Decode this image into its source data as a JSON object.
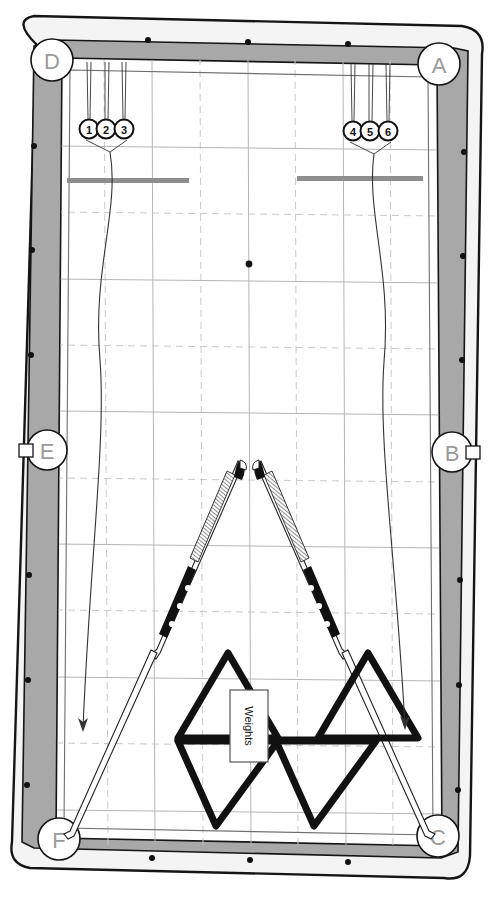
{
  "diagram": {
    "type": "billiard-table-schematic"
  },
  "table": {
    "cloth_color": "#ffffff",
    "rail_color": "#a8a8a8",
    "frame_outline_color": "#1a1a1a",
    "grid_color": "#b9b9b9",
    "grid_dashed_color": "#c7c7c7"
  },
  "pockets": [
    {
      "id": "A",
      "label": "A",
      "position": "top-right",
      "kind": "corner"
    },
    {
      "id": "B",
      "label": "B",
      "position": "right-middle",
      "kind": "side"
    },
    {
      "id": "C",
      "label": "C",
      "position": "bottom-right",
      "kind": "corner"
    },
    {
      "id": "D",
      "label": "D",
      "position": "top-left",
      "kind": "corner"
    },
    {
      "id": "E",
      "label": "E",
      "position": "left-middle",
      "kind": "side"
    },
    {
      "id": "F",
      "label": "F",
      "position": "bottom-left",
      "kind": "corner"
    }
  ],
  "callouts": {
    "left_group": {
      "labels": [
        "1",
        "2",
        "3"
      ],
      "target": "lower-left area",
      "arrow_direction": "down"
    },
    "right_group": {
      "labels": [
        "4",
        "5",
        "6"
      ],
      "target": "lower-right area",
      "arrow_direction": "down"
    }
  },
  "markers": {
    "center_spot": "center-table-spot",
    "head_string_bars": [
      "left-grey-bar",
      "right-grey-bar"
    ],
    "rail_diamond_count_long_side": 6,
    "rail_diamond_count_short_side": 3
  },
  "equipment": {
    "cues": [
      {
        "id": "cue-left",
        "orientation": "leaning-up-right",
        "has_wrap": true,
        "has_inlay_dots": true
      },
      {
        "id": "cue-right",
        "orientation": "leaning-up-left",
        "has_wrap": true,
        "has_inlay_dots": true
      }
    ],
    "racks": [
      {
        "id": "rack-top-left",
        "shape": "triangle"
      },
      {
        "id": "rack-top-right",
        "shape": "triangle"
      },
      {
        "id": "rack-bottom-left",
        "shape": "triangle"
      },
      {
        "id": "rack-bottom-right",
        "shape": "triangle"
      }
    ],
    "weights_box": {
      "label": "Weights",
      "orientation": "vertical-text"
    }
  }
}
